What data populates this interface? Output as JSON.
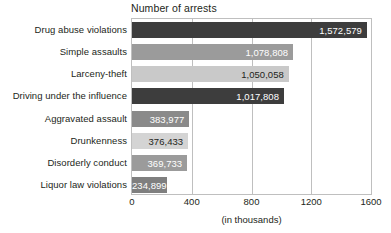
{
  "chart_data": {
    "type": "bar",
    "orientation": "horizontal",
    "title": "Number of arrests",
    "xlabel": "(in thousands)",
    "ylabel": "",
    "xlim": [
      0,
      1600
    ],
    "xticks": [
      0,
      400,
      800,
      1200,
      1600
    ],
    "xtick_labels": [
      "0",
      "400",
      "800",
      "1200",
      "1600"
    ],
    "grid": true,
    "grid_axis": "x",
    "legend": "none",
    "value_units": "arrests",
    "categories": [
      "Drug abuse violations",
      "Simple assaults",
      "Larceny-theft",
      "Driving under the influence",
      "Aggravated assault",
      "Drunkenness",
      "Disorderly conduct",
      "Liquor law violations"
    ],
    "values": [
      1572579,
      1078808,
      1050058,
      1017808,
      383977,
      376433,
      369733,
      234899
    ],
    "value_labels": [
      "1,572,579",
      "1,078,808",
      "1,050,058",
      "1,017,808",
      "383,977",
      "376,433",
      "369,733",
      "234,899"
    ],
    "bar_colors": [
      "#3d3d3d",
      "#9b9b9b",
      "#c9c9c9",
      "#3d3d3d",
      "#8a8a8a",
      "#d4d4d4",
      "#9b9b9b",
      "#7f7f7f"
    ],
    "value_label_colors": [
      "#ffffff",
      "#ffffff",
      "#231f20",
      "#ffffff",
      "#ffffff",
      "#231f20",
      "#ffffff",
      "#ffffff"
    ],
    "plot_border_color": "#bfbfbf",
    "grid_color": "#bfbfbf",
    "background": "#ffffff",
    "text_color": "#231f20"
  }
}
